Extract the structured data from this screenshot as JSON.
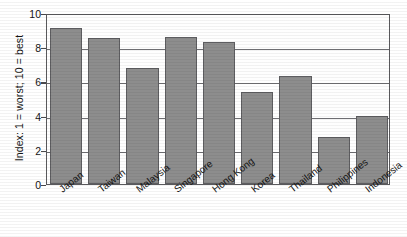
{
  "chart_data": {
    "type": "bar",
    "title": "",
    "xlabel": "",
    "ylabel": "Index: 1 = worst; 10 = best",
    "categories": [
      "Japan",
      "Taiwan",
      "Malaysia",
      "Singapore",
      "Hong Kong",
      "Korea",
      "Thailand",
      "Philippines",
      "Indonesia"
    ],
    "values": [
      9.1,
      8.55,
      6.8,
      8.6,
      8.3,
      5.4,
      6.3,
      2.75,
      4.0
    ],
    "ylim": [
      0,
      10
    ],
    "yticks": [
      0,
      2,
      4,
      6,
      8,
      10
    ],
    "ytick_labels": [
      "0",
      "2",
      "4",
      "6",
      "8",
      "10"
    ],
    "grid": true,
    "legend": false,
    "bar_color": "#8d8d8d",
    "bar_border_color": "#5d5d60",
    "axis_color": "#59595c",
    "background": "#ffffff"
  }
}
